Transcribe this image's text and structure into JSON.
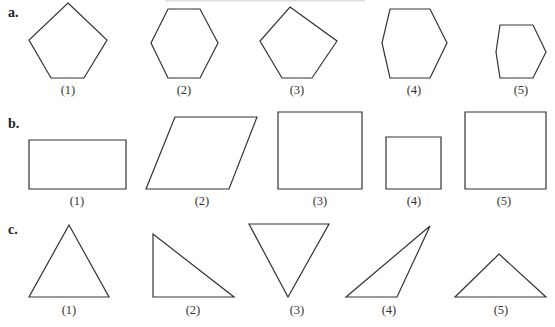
{
  "figure": {
    "sections": [
      {
        "id": "a",
        "label": "a.",
        "category": "polygons (pentagons and hexagons)",
        "items": [
          {
            "label": "(1)",
            "shape": "regular pentagon",
            "points": [
              [
                68,
                3
              ],
              [
                107,
                40
              ],
              [
                84,
                78
              ],
              [
                51,
                78
              ],
              [
                29,
                40
              ]
            ],
            "label_pos": [
              68,
              94
            ]
          },
          {
            "label": "(2)",
            "shape": "hexagon",
            "points": [
              [
                168,
                9
              ],
              [
                200,
                9
              ],
              [
                218,
                43
              ],
              [
                200,
                78
              ],
              [
                168,
                78
              ],
              [
                151,
                43
              ]
            ],
            "label_pos": [
              184,
              94
            ]
          },
          {
            "label": "(3)",
            "shape": "irregular pentagon",
            "points": [
              [
                290,
                7
              ],
              [
                337,
                41
              ],
              [
                312,
                78
              ],
              [
                282,
                78
              ],
              [
                260,
                41
              ]
            ],
            "label_pos": [
              297,
              94
            ]
          },
          {
            "label": "(4)",
            "shape": "hexagon",
            "points": [
              [
                390,
                9
              ],
              [
                430,
                9
              ],
              [
                447,
                43
              ],
              [
                430,
                78
              ],
              [
                390,
                78
              ],
              [
                382,
                43
              ]
            ],
            "label_pos": [
              414,
              94
            ]
          },
          {
            "label": "(5)",
            "shape": "small hexagon",
            "points": [
              [
                500,
                25
              ],
              [
                533,
                25
              ],
              [
                546,
                52
              ],
              [
                533,
                78
              ],
              [
                500,
                78
              ],
              [
                496,
                52
              ]
            ],
            "label_pos": [
              521,
              94
            ]
          }
        ]
      },
      {
        "id": "b",
        "label": "b.",
        "category": "quadrilaterals",
        "items": [
          {
            "label": "(1)",
            "shape": "rectangle",
            "points": [
              [
                29,
                140
              ],
              [
                126,
                140
              ],
              [
                126,
                189
              ],
              [
                29,
                189
              ]
            ],
            "label_pos": [
              77,
              205
            ]
          },
          {
            "label": "(2)",
            "shape": "parallelogram",
            "points": [
              [
                175,
                117
              ],
              [
                257,
                117
              ],
              [
                229,
                189
              ],
              [
                146,
                189
              ]
            ],
            "label_pos": [
              202,
              205
            ]
          },
          {
            "label": "(3)",
            "shape": "square",
            "points": [
              [
                278,
                112
              ],
              [
                362,
                112
              ],
              [
                362,
                189
              ],
              [
                278,
                189
              ]
            ],
            "label_pos": [
              320,
              205
            ]
          },
          {
            "label": "(4)",
            "shape": "small square",
            "points": [
              [
                386,
                137
              ],
              [
                441,
                137
              ],
              [
                441,
                189
              ],
              [
                386,
                189
              ]
            ],
            "label_pos": [
              414,
              205
            ]
          },
          {
            "label": "(5)",
            "shape": "square",
            "points": [
              [
                465,
                112
              ],
              [
                546,
                112
              ],
              [
                546,
                189
              ],
              [
                465,
                189
              ]
            ],
            "label_pos": [
              504,
              205
            ]
          }
        ]
      },
      {
        "id": "c",
        "label": "c.",
        "category": "triangles",
        "items": [
          {
            "label": "(1)",
            "shape": "equilateral triangle",
            "points": [
              [
                69,
                225
              ],
              [
                109,
                297
              ],
              [
                29,
                297
              ]
            ],
            "label_pos": [
              69,
              314
            ]
          },
          {
            "label": "(2)",
            "shape": "right triangle",
            "points": [
              [
                153,
                234
              ],
              [
                234,
                297
              ],
              [
                153,
                297
              ]
            ],
            "label_pos": [
              193,
              314
            ]
          },
          {
            "label": "(3)",
            "shape": "inverted triangle",
            "points": [
              [
                249,
                224
              ],
              [
                329,
                224
              ],
              [
                288,
                297
              ]
            ],
            "label_pos": [
              297,
              314
            ]
          },
          {
            "label": "(4)",
            "shape": "obtuse triangle",
            "points": [
              [
                430,
                226
              ],
              [
                397,
                297
              ],
              [
                346,
                297
              ]
            ],
            "label_pos": [
              389,
              314
            ]
          },
          {
            "label": "(5)",
            "shape": "obtuse isosceles triangle",
            "points": [
              [
                499,
                254
              ],
              [
                546,
                297
              ],
              [
                455,
                297
              ]
            ],
            "label_pos": [
              501,
              314
            ]
          }
        ]
      }
    ],
    "section_label_pos": {
      "a": [
        8,
        17
      ],
      "b": [
        8,
        128
      ],
      "c": [
        8,
        234
      ]
    }
  }
}
